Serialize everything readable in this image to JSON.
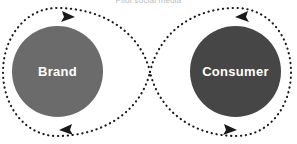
{
  "diagram": {
    "title": "Pilot social media",
    "type": "infinity-loop",
    "background_color": "#ffffff",
    "path_color": "#1a1a1a",
    "path_style": "dotted",
    "nodes": [
      {
        "id": "brand",
        "label": "Brand",
        "fill_color": "#6b6b6b",
        "text_color": "#ffffff",
        "center_x": 57,
        "center_y": 72,
        "diameter": 91
      },
      {
        "id": "consumer",
        "label": "Consumer",
        "fill_color": "#464646",
        "text_color": "#ffffff",
        "center_x": 236,
        "center_y": 72,
        "diameter": 91
      }
    ],
    "arrows": [
      {
        "id": "arrow-top-left",
        "position": "top-left",
        "direction": "right",
        "color": "#1a1a1a"
      },
      {
        "id": "arrow-top-right",
        "position": "top-right",
        "direction": "left",
        "color": "#1a1a1a"
      },
      {
        "id": "arrow-bottom-left",
        "position": "bottom-left",
        "direction": "left",
        "color": "#1a1a1a"
      },
      {
        "id": "arrow-bottom-right",
        "position": "bottom-right",
        "direction": "right",
        "color": "#1a1a1a"
      }
    ],
    "crossing_point": {
      "x": 150,
      "y": 72
    }
  }
}
